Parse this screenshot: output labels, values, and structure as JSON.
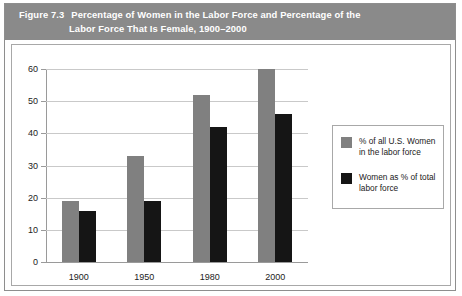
{
  "figure": {
    "label": "Figure 7.3",
    "title_line1": "Percentage of Women in the Labor Force and Percentage of the",
    "title_line2": "Labor Force That Is Female, 1900–2000"
  },
  "colors": {
    "header_band": "#8a8a8a",
    "series_a": "#808080",
    "series_b": "#151515",
    "gridline": "#c9c9c9",
    "axis": "#9a9a9a",
    "panel_border": "#a8a8a8"
  },
  "legend": {
    "items": [
      {
        "label": "% of all U.S. Women in the labor force",
        "color": "#808080"
      },
      {
        "label": "Women as % of total labor force",
        "color": "#151515"
      }
    ]
  },
  "chart_data": {
    "type": "bar",
    "title": "Percentage of Women in the Labor Force and Percentage of the Labor Force That Is Female, 1900–2000",
    "xlabel": "",
    "ylabel": "",
    "categories": [
      "1900",
      "1950",
      "1980",
      "2000"
    ],
    "series": [
      {
        "name": "% of all U.S. Women in the labor force",
        "color": "#808080",
        "values": [
          19,
          33,
          52,
          60
        ]
      },
      {
        "name": "Women as % of total labor force",
        "color": "#151515",
        "values": [
          16,
          19,
          42,
          46
        ]
      }
    ],
    "ylim": [
      0,
      60
    ],
    "yticks": [
      0,
      10,
      20,
      30,
      40,
      50,
      60
    ],
    "ytick_labels": [
      "0",
      "10",
      "20",
      "30",
      "40",
      "50",
      "60"
    ],
    "grid": true,
    "legend_position": "right"
  }
}
